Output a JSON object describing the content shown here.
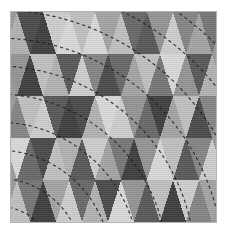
{
  "figure": {
    "kind": "triangular-tessellation-pattern",
    "frame": {
      "x": 11,
      "y": 12,
      "width": 205,
      "height": 210
    },
    "background_color": "#9a9a9a",
    "page_background_color": "#ffffff"
  },
  "chart_data": {
    "type": "heatmap",
    "title": "",
    "subtitle": "",
    "xlabel": "",
    "ylabel": "",
    "grid": false,
    "legend": null,
    "annotations": [],
    "tiling": {
      "rows": 5,
      "cols": 16,
      "cell_width": 26,
      "row_height": 42,
      "orientation": "alternating-up-down-triangles",
      "origin_x": -7,
      "origin_y": 0
    },
    "palette": {
      "levels": [
        "#3e3e3e",
        "#4a4a4a",
        "#585858",
        "#686868",
        "#767676",
        "#848484",
        "#949494",
        "#a4a4a4",
        "#b2b2b2",
        "#c0c0c0",
        "#cdcdcd",
        "#d9d9d9"
      ]
    },
    "rows_shades": [
      [
        8,
        1,
        0,
        10,
        11,
        9,
        11,
        7,
        9,
        3,
        2,
        6,
        10,
        5,
        7,
        4
      ],
      [
        6,
        0,
        9,
        8,
        2,
        10,
        5,
        1,
        3,
        7,
        9,
        4,
        11,
        6,
        2,
        8
      ],
      [
        5,
        9,
        10,
        2,
        0,
        1,
        8,
        11,
        10,
        6,
        3,
        0,
        7,
        9,
        1,
        5
      ],
      [
        11,
        3,
        1,
        9,
        8,
        2,
        10,
        7,
        4,
        0,
        6,
        11,
        9,
        2,
        5,
        10
      ],
      [
        9,
        4,
        0,
        7,
        10,
        3,
        8,
        1,
        11,
        6,
        2,
        9,
        0,
        10,
        5,
        7
      ]
    ],
    "arcs": {
      "center_x": -14,
      "center_y": 252,
      "radii": [
        58,
        86,
        114,
        142,
        170,
        198,
        226,
        254,
        282,
        310,
        338
      ],
      "stroke_color": "#1a1a1a",
      "dash": "3.2 3.0",
      "stroke_width": 1.1
    }
  }
}
